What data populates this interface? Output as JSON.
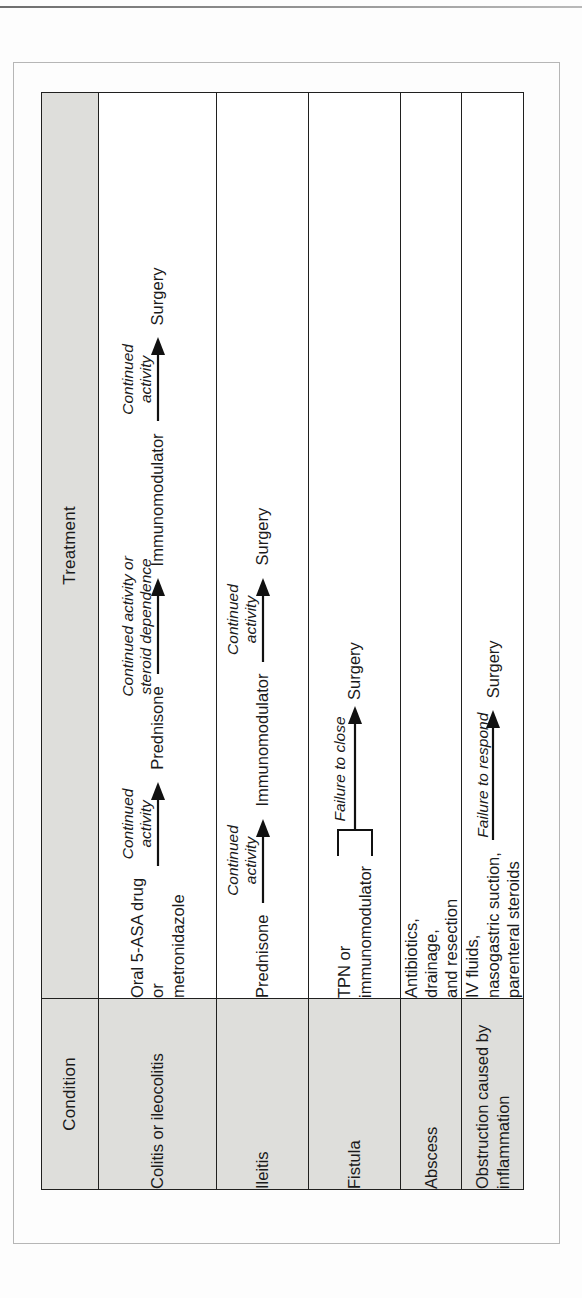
{
  "table": {
    "headers": {
      "condition": "Condition",
      "treatment": "Treatment"
    },
    "rows": [
      {
        "condition": "Colitis or ileocolitis",
        "steps": [
          {
            "kind": "node",
            "text": "Oral 5-ASA drug\nor\nmetronidazole"
          },
          {
            "kind": "arrow",
            "caption": "Continued\nactivity"
          },
          {
            "kind": "node",
            "text": "Prednisone"
          },
          {
            "kind": "arrow",
            "caption": "Continued activity or\nsteroid dependence"
          },
          {
            "kind": "node",
            "text": "Immunomodulator"
          },
          {
            "kind": "arrow",
            "caption": "Continued\nactivity"
          },
          {
            "kind": "node",
            "text": "Surgery"
          }
        ]
      },
      {
        "condition": "Ileitis",
        "steps": [
          {
            "kind": "node",
            "text": "Prednisone"
          },
          {
            "kind": "arrow",
            "caption": "Continued\nactivity"
          },
          {
            "kind": "node",
            "text": "Immunomodulator"
          },
          {
            "kind": "arrow",
            "caption": "Continued\nactivity"
          },
          {
            "kind": "node",
            "text": "Surgery"
          }
        ]
      },
      {
        "condition": "Fistula",
        "steps": [
          {
            "kind": "node",
            "text": "TPN or\nimmunomodulator"
          },
          {
            "kind": "brace-arrow",
            "caption": "Failure to close"
          },
          {
            "kind": "node",
            "text": "Surgery"
          }
        ]
      },
      {
        "condition": "Abscess",
        "steps": [
          {
            "kind": "node",
            "text": "Antibiotics,\ndrainage,\nand resection"
          }
        ]
      },
      {
        "condition": "Obstruction caused by\ninflammation",
        "steps": [
          {
            "kind": "node",
            "text": "IV fluids,\nnasogastric suction,\nparenteral steroids"
          },
          {
            "kind": "arrow",
            "caption": "Failure to respond"
          },
          {
            "kind": "node",
            "text": "Surgery"
          }
        ]
      }
    ]
  },
  "colors": {
    "header_fill": "#dededb",
    "rule": "#20201f",
    "text": "#1a1a1a",
    "page": "#fdfdfd"
  }
}
